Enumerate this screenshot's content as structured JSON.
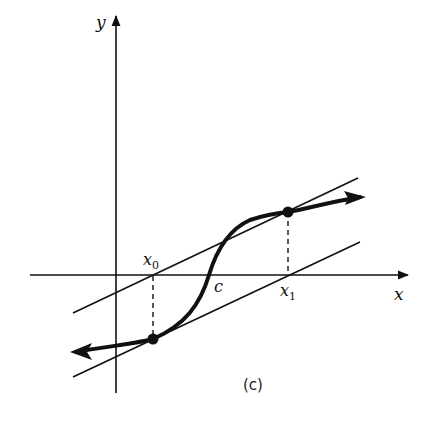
{
  "figure": {
    "caption": "(c)",
    "axes": {
      "x_label": "x",
      "y_label": "y"
    },
    "points": {
      "x0_label": "x",
      "x0_sub": "0",
      "c_label": "c",
      "x1_label": "x",
      "x1_sub": "1"
    },
    "colors": {
      "ink": "#111111",
      "background": "#ffffff"
    },
    "elements": [
      "parallel line upper (through x0 on axis, tangent at x1)",
      "parallel line lower (through x1 on axis, tangent at x0)",
      "S-shaped curve through c with arrows at both ends",
      "dashed vertical segments from x0 and x1 to curve points"
    ]
  }
}
